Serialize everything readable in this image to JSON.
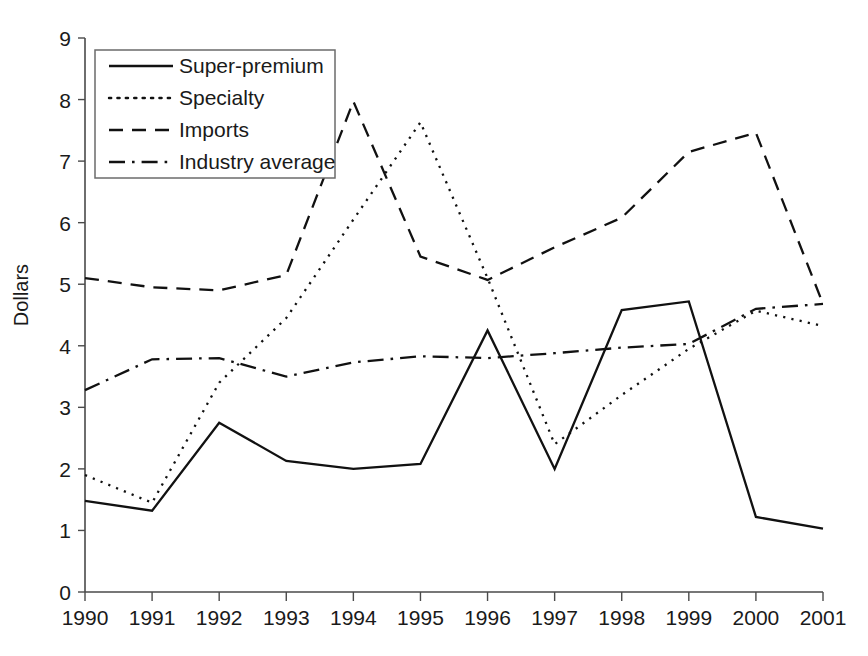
{
  "chart_data": {
    "type": "line",
    "title": "",
    "xlabel": "",
    "ylabel": "Dollars",
    "x": [
      "1990",
      "1991",
      "1992",
      "1993",
      "1994",
      "1995",
      "1996",
      "1997",
      "1998",
      "1999",
      "2000",
      "2001"
    ],
    "categories": [
      "1990",
      "1991",
      "1992",
      "1993",
      "1994",
      "1995",
      "1996",
      "1997",
      "1998",
      "1999",
      "2000",
      "2001"
    ],
    "ylim": [
      0,
      9
    ],
    "yticks": [
      "0",
      "1",
      "2",
      "3",
      "4",
      "5",
      "6",
      "7",
      "8",
      "9"
    ],
    "grid": false,
    "legend_position": "top-left",
    "series": [
      {
        "name": "Super-premium",
        "dash": "solid",
        "values": [
          1.48,
          1.32,
          2.75,
          2.13,
          2.0,
          2.08,
          4.25,
          2.0,
          4.58,
          4.72,
          1.22,
          1.03
        ]
      },
      {
        "name": "Specialty",
        "dash": "dotted",
        "values": [
          1.9,
          1.45,
          3.4,
          4.45,
          6.05,
          7.63,
          5.1,
          2.4,
          3.2,
          3.95,
          4.57,
          4.32
        ]
      },
      {
        "name": "Imports",
        "dash": "dashed",
        "values": [
          5.1,
          4.95,
          4.9,
          5.15,
          7.97,
          5.45,
          5.07,
          5.6,
          6.08,
          7.15,
          7.46,
          4.68
        ]
      },
      {
        "name": "Industry average",
        "dash": "dashdot",
        "values": [
          3.28,
          3.78,
          3.8,
          3.5,
          3.73,
          3.83,
          3.8,
          3.88,
          3.97,
          4.03,
          4.6,
          4.68
        ]
      }
    ]
  },
  "legend": {
    "entries": [
      {
        "label": "Super-premium"
      },
      {
        "label": "Specialty"
      },
      {
        "label": "Imports"
      },
      {
        "label": "Industry average"
      }
    ]
  },
  "axes": {
    "y_title": "Dollars"
  },
  "colors": {
    "line": "#111111",
    "axis": "#4a4a4a",
    "text": "#1a1a1a",
    "background": "#ffffff"
  }
}
